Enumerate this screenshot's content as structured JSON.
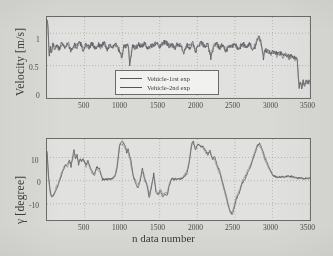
{
  "figure": {
    "background_color": "#d9d9d6",
    "axis_color": "#6b6b68",
    "trace_color_1": "#4a4b50",
    "trace_color_2": "#6a6b70",
    "grid": "dotted-light"
  },
  "chart_data": [
    {
      "type": "line",
      "panel": "top",
      "title": "",
      "xlabel": "",
      "ylabel": "Velocity [m/s]",
      "xlim": [
        0,
        3500
      ],
      "ylim": [
        0,
        1.25
      ],
      "xticks": [
        500,
        1000,
        1500,
        2000,
        2500,
        3000,
        3500
      ],
      "xticklabels": [
        "500",
        "1000",
        "1500",
        "2000",
        "2500",
        "3000",
        "3500"
      ],
      "yticks": [
        0,
        0.5,
        1
      ],
      "yticklabels": [
        "0",
        "0.5",
        "1"
      ],
      "grid": true,
      "legend": {
        "position": "lower-center-inside",
        "entries": [
          "Vehicle-1rst exp",
          "Vehicle-2nd exp"
        ]
      },
      "series": [
        {
          "name": "Vehicle-1rst exp",
          "x": [
            0,
            15,
            30,
            45,
            60,
            80,
            100,
            130,
            160,
            200,
            240,
            280,
            320,
            360,
            400,
            440,
            480,
            520,
            560,
            600,
            640,
            680,
            720,
            760,
            800,
            840,
            880,
            920,
            960,
            1000,
            1020,
            1050,
            1080,
            1100,
            1140,
            1180,
            1220,
            1260,
            1300,
            1340,
            1380,
            1420,
            1460,
            1500,
            1540,
            1580,
            1620,
            1660,
            1700,
            1740,
            1780,
            1820,
            1860,
            1900,
            1940,
            1980,
            2020,
            2060,
            2100,
            2140,
            2180,
            2220,
            2260,
            2300,
            2340,
            2380,
            2420,
            2460,
            2500,
            2540,
            2580,
            2620,
            2660,
            2700,
            2740,
            2780,
            2820,
            2860,
            2880,
            2900,
            2940,
            2980,
            3020,
            3060,
            3100,
            3140,
            3180,
            3220,
            3260,
            3300,
            3330,
            3345,
            3355,
            3370,
            3390,
            3410,
            3430,
            3450,
            3470,
            3490,
            3500
          ],
          "y": [
            1.24,
            1.05,
            0.62,
            0.8,
            0.7,
            0.85,
            0.76,
            0.82,
            0.74,
            0.86,
            0.78,
            0.84,
            0.72,
            0.82,
            0.79,
            0.86,
            0.74,
            0.83,
            0.77,
            0.85,
            0.76,
            0.82,
            0.8,
            0.86,
            0.75,
            0.83,
            0.78,
            0.84,
            0.72,
            0.6,
            0.82,
            0.78,
            0.84,
            0.52,
            0.8,
            0.76,
            0.83,
            0.79,
            0.85,
            0.74,
            0.82,
            0.8,
            0.87,
            0.78,
            0.84,
            0.88,
            0.8,
            0.83,
            0.76,
            0.84,
            0.8,
            0.68,
            0.82,
            0.78,
            0.84,
            0.72,
            0.81,
            0.86,
            0.78,
            0.83,
            0.62,
            0.8,
            0.84,
            0.77,
            0.83,
            0.7,
            0.82,
            0.79,
            0.85,
            0.74,
            0.8,
            0.83,
            0.78,
            0.84,
            0.72,
            0.82,
            0.98,
            0.8,
            0.62,
            0.74,
            0.72,
            0.7,
            0.71,
            0.68,
            0.69,
            0.66,
            0.67,
            0.64,
            0.66,
            0.62,
            0.63,
            0.3,
            0.18,
            0.24,
            0.16,
            0.26,
            0.2,
            0.28,
            0.22,
            0.26,
            0.24
          ]
        },
        {
          "name": "Vehicle-2nd exp",
          "x": [
            0,
            15,
            30,
            45,
            60,
            80,
            100,
            130,
            160,
            200,
            240,
            280,
            320,
            360,
            400,
            440,
            480,
            520,
            560,
            600,
            640,
            680,
            720,
            760,
            800,
            840,
            880,
            920,
            960,
            1000,
            1020,
            1050,
            1080,
            1100,
            1140,
            1180,
            1220,
            1260,
            1300,
            1340,
            1380,
            1420,
            1460,
            1500,
            1540,
            1580,
            1620,
            1660,
            1700,
            1740,
            1780,
            1820,
            1860,
            1900,
            1940,
            1980,
            2020,
            2060,
            2100,
            2140,
            2180,
            2220,
            2260,
            2300,
            2340,
            2380,
            2420,
            2460,
            2500,
            2540,
            2580,
            2620,
            2660,
            2700,
            2740,
            2780,
            2820,
            2860,
            2880,
            2900,
            2940,
            2980,
            3020,
            3060,
            3100,
            3140,
            3180,
            3220,
            3260,
            3300,
            3330,
            3345,
            3355,
            3370,
            3390,
            3410,
            3430,
            3450,
            3470,
            3490,
            3500
          ],
          "y": [
            1.22,
            0.98,
            0.66,
            0.78,
            0.74,
            0.83,
            0.79,
            0.8,
            0.77,
            0.84,
            0.76,
            0.86,
            0.75,
            0.8,
            0.82,
            0.84,
            0.77,
            0.81,
            0.79,
            0.83,
            0.78,
            0.84,
            0.77,
            0.84,
            0.78,
            0.81,
            0.8,
            0.82,
            0.75,
            0.64,
            0.8,
            0.8,
            0.82,
            0.56,
            0.78,
            0.79,
            0.81,
            0.81,
            0.83,
            0.77,
            0.8,
            0.82,
            0.85,
            0.8,
            0.82,
            0.86,
            0.82,
            0.81,
            0.79,
            0.82,
            0.82,
            0.72,
            0.8,
            0.8,
            0.82,
            0.75,
            0.83,
            0.84,
            0.8,
            0.81,
            0.66,
            0.82,
            0.82,
            0.79,
            0.81,
            0.74,
            0.8,
            0.81,
            0.83,
            0.77,
            0.82,
            0.81,
            0.8,
            0.82,
            0.75,
            0.84,
            0.94,
            0.78,
            0.66,
            0.72,
            0.74,
            0.68,
            0.72,
            0.66,
            0.7,
            0.64,
            0.68,
            0.62,
            0.64,
            0.6,
            0.58,
            0.26,
            0.22,
            0.2,
            0.2,
            0.22,
            0.24,
            0.24,
            0.26,
            0.22,
            0.22
          ]
        }
      ]
    },
    {
      "type": "line",
      "panel": "bottom",
      "title": "",
      "xlabel": "n data number",
      "ylabel": "γ [degree]",
      "xlim": [
        0,
        3500
      ],
      "ylim": [
        -17,
        18
      ],
      "xticks": [
        500,
        1000,
        1500,
        2000,
        2500,
        3000,
        3500
      ],
      "xticklabels": [
        "500",
        "1000",
        "1500",
        "2000",
        "2500",
        "3000",
        "3500"
      ],
      "yticks": [
        -10,
        0,
        10
      ],
      "yticklabels": [
        "-10",
        "0",
        "10"
      ],
      "grid": true,
      "series": [
        {
          "name": "Vehicle-1rst exp",
          "x": [
            0,
            20,
            40,
            60,
            90,
            120,
            150,
            180,
            210,
            240,
            270,
            300,
            320,
            340,
            360,
            380,
            400,
            420,
            440,
            460,
            480,
            500,
            520,
            545,
            570,
            600,
            630,
            660,
            700,
            740,
            780,
            820,
            860,
            900,
            930,
            950,
            965,
            980,
            1000,
            1020,
            1040,
            1060,
            1080,
            1100,
            1120,
            1150,
            1180,
            1210,
            1240,
            1270,
            1300,
            1330,
            1360,
            1390,
            1420,
            1450,
            1480,
            1510,
            1540,
            1570,
            1600,
            1630,
            1660,
            1700,
            1740,
            1780,
            1820,
            1860,
            1890,
            1910,
            1930,
            1950,
            1975,
            2000,
            2025,
            2050,
            2080,
            2110,
            2140,
            2170,
            2200,
            2230,
            2260,
            2300,
            2340,
            2380,
            2410,
            2440,
            2465,
            2490,
            2520,
            2560,
            2600,
            2640,
            2680,
            2720,
            2760,
            2800,
            2830,
            2860,
            2900,
            2940,
            2980,
            3020,
            3060,
            3100,
            3160,
            3220,
            3280,
            3340,
            3400,
            3460,
            3500
          ],
          "y": [
            13.0,
            2.0,
            -4.0,
            -7.0,
            -6.0,
            -4.0,
            -2.0,
            1.0,
            4.0,
            6.5,
            7.0,
            9.0,
            6.0,
            10.0,
            13.5,
            9.5,
            11.0,
            7.0,
            9.5,
            8.0,
            9.5,
            8.0,
            7.0,
            9.0,
            6.0,
            4.0,
            2.0,
            6.0,
            5.0,
            0.5,
            0.5,
            0.5,
            1.0,
            1.5,
            5.0,
            10.0,
            14.5,
            16.5,
            17.0,
            16.0,
            15.0,
            12.0,
            13.5,
            11.0,
            8.0,
            1.5,
            -1.0,
            -3.5,
            0.0,
            5.5,
            1.0,
            -2.0,
            -7.5,
            -3.0,
            3.0,
            -5.0,
            -6.0,
            -4.5,
            -7.0,
            -5.5,
            -6.5,
            -2.0,
            1.0,
            0.5,
            1.0,
            0.5,
            1.5,
            3.0,
            7.0,
            12.0,
            16.0,
            17.0,
            13.0,
            15.5,
            16.0,
            14.0,
            15.0,
            13.0,
            11.0,
            13.0,
            9.0,
            10.5,
            7.0,
            4.0,
            -1.0,
            -6.0,
            -10.0,
            -13.5,
            -14.5,
            -12.0,
            -8.0,
            -5.0,
            -1.0,
            1.0,
            4.0,
            7.0,
            11.0,
            15.0,
            16.0,
            14.0,
            10.0,
            7.0,
            4.0,
            2.0,
            1.5,
            1.8,
            1.5,
            2.0,
            1.6,
            1.2,
            1.0,
            1.0,
            1.0
          ]
        },
        {
          "name": "Vehicle-2nd exp",
          "x": [
            0,
            20,
            40,
            60,
            90,
            120,
            150,
            180,
            210,
            240,
            270,
            300,
            320,
            340,
            360,
            380,
            400,
            420,
            440,
            460,
            480,
            500,
            520,
            545,
            570,
            600,
            630,
            660,
            700,
            740,
            780,
            820,
            860,
            900,
            930,
            950,
            965,
            980,
            1000,
            1020,
            1040,
            1060,
            1080,
            1100,
            1120,
            1150,
            1180,
            1210,
            1240,
            1270,
            1300,
            1330,
            1360,
            1390,
            1420,
            1450,
            1480,
            1510,
            1540,
            1570,
            1600,
            1630,
            1660,
            1700,
            1740,
            1780,
            1820,
            1860,
            1890,
            1910,
            1930,
            1950,
            1975,
            2000,
            2025,
            2050,
            2080,
            2110,
            2140,
            2170,
            2200,
            2230,
            2260,
            2300,
            2340,
            2380,
            2410,
            2440,
            2465,
            2490,
            2520,
            2560,
            2600,
            2640,
            2680,
            2720,
            2760,
            2800,
            2830,
            2860,
            2900,
            2940,
            2980,
            3020,
            3060,
            3100,
            3160,
            3220,
            3280,
            3340,
            3400,
            3460,
            3500
          ],
          "y": [
            12.0,
            1.0,
            -5.0,
            -6.5,
            -6.5,
            -3.0,
            -1.0,
            2.0,
            5.0,
            7.0,
            6.0,
            8.0,
            7.5,
            9.0,
            12.0,
            10.5,
            10.0,
            8.0,
            9.0,
            8.5,
            9.0,
            8.5,
            6.0,
            8.0,
            5.5,
            3.0,
            3.0,
            5.0,
            4.0,
            1.0,
            0.5,
            1.0,
            0.5,
            2.0,
            6.0,
            11.0,
            15.5,
            16.0,
            16.0,
            15.0,
            14.0,
            13.5,
            12.0,
            10.0,
            6.0,
            2.0,
            0.0,
            -2.0,
            1.0,
            4.0,
            0.0,
            -1.0,
            -6.0,
            -2.0,
            2.0,
            -4.0,
            -5.5,
            -3.5,
            -6.0,
            -5.0,
            -5.5,
            -1.0,
            0.5,
            1.0,
            0.5,
            1.0,
            2.0,
            4.0,
            8.0,
            13.0,
            17.0,
            16.0,
            14.0,
            16.0,
            15.0,
            15.0,
            14.0,
            12.0,
            12.0,
            12.0,
            10.0,
            9.0,
            6.0,
            3.0,
            -2.0,
            -7.0,
            -11.0,
            -14.0,
            -13.5,
            -11.0,
            -7.0,
            -4.0,
            0.0,
            2.0,
            5.0,
            8.0,
            12.0,
            15.5,
            15.0,
            13.0,
            9.0,
            6.0,
            3.5,
            2.0,
            1.5,
            1.5,
            1.6,
            1.8,
            1.4,
            1.0,
            1.0,
            1.0,
            1.0
          ]
        }
      ]
    }
  ],
  "panels": {
    "velocity": {
      "ylabel": "Velocity [m/s]",
      "yticklabels": [
        "1",
        "0.5",
        "0"
      ],
      "xticklabels": [
        "500",
        "1000",
        "1500",
        "2000",
        "2500",
        "3000",
        "3500"
      ],
      "legend": {
        "entry1": "Vehicle-1rst exp",
        "entry2": "Vehicle-2nd exp"
      }
    },
    "gamma": {
      "ylabel": "γ [degree]",
      "yticklabels": [
        "10",
        "0",
        "-10"
      ],
      "xticklabels": [
        "500",
        "1000",
        "1500",
        "2000",
        "2500",
        "3000",
        "3500"
      ],
      "xlabel": "n data number"
    }
  }
}
